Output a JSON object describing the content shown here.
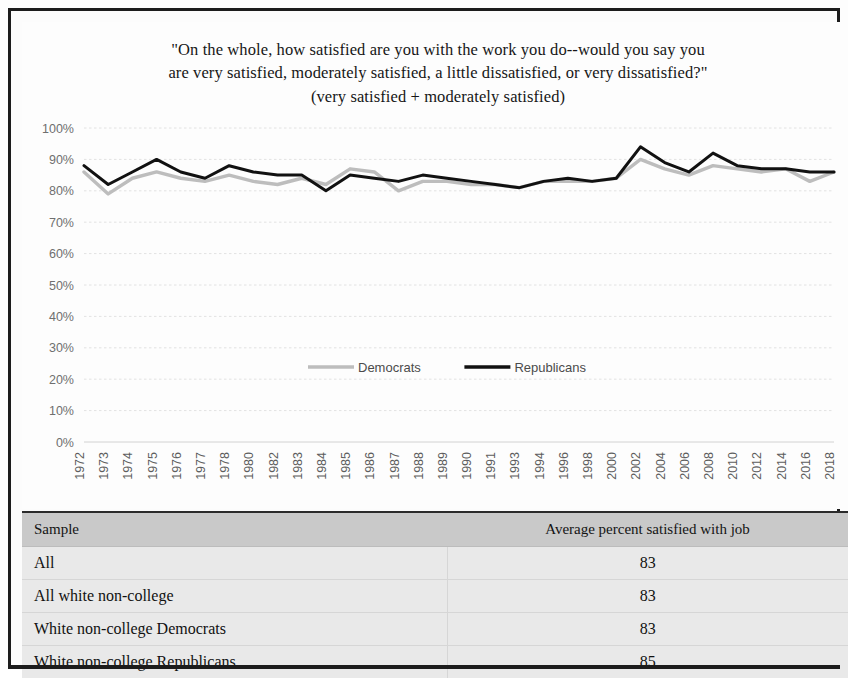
{
  "figure": {
    "title_lines": [
      "\"On the whole, how satisfied are you with the work you do--would you say you",
      "are very satisfied, moderately satisfied, a little dissatisfied, or very dissatisfied?\"",
      "(very satisfied + moderately satisfied)"
    ]
  },
  "chart_data": {
    "type": "line",
    "xlabel": "",
    "ylabel": "",
    "ylim": [
      0,
      100
    ],
    "ytick_labels": [
      "0%",
      "10%",
      "20%",
      "30%",
      "40%",
      "50%",
      "60%",
      "70%",
      "80%",
      "90%",
      "100%"
    ],
    "ytick_values": [
      0,
      10,
      20,
      30,
      40,
      50,
      60,
      70,
      80,
      90,
      100
    ],
    "grid": true,
    "legend_position": "center",
    "categories": [
      "1972",
      "1973",
      "1974",
      "1975",
      "1976",
      "1977",
      "1978",
      "1980",
      "1982",
      "1983",
      "1984",
      "1985",
      "1986",
      "1987",
      "1988",
      "1989",
      "1990",
      "1991",
      "1993",
      "1994",
      "1996",
      "1998",
      "2000",
      "2002",
      "2004",
      "2006",
      "2008",
      "2010",
      "2012",
      "2014",
      "2016",
      "2018"
    ],
    "series": [
      {
        "name": "Democrats",
        "color": "#bdbdbd",
        "values": [
          86,
          79,
          84,
          86,
          84,
          83,
          85,
          83,
          82,
          84,
          82,
          87,
          86,
          80,
          83,
          83,
          82,
          82,
          81,
          83,
          83,
          83,
          84,
          90,
          87,
          85,
          88,
          87,
          86,
          87,
          83,
          86
        ]
      },
      {
        "name": "Republicans",
        "color": "#111111",
        "values": [
          88,
          82,
          86,
          90,
          86,
          84,
          88,
          86,
          85,
          85,
          80,
          85,
          84,
          83,
          85,
          84,
          83,
          82,
          81,
          83,
          84,
          83,
          84,
          94,
          89,
          86,
          92,
          88,
          87,
          87,
          86,
          86
        ]
      }
    ]
  },
  "table": {
    "columns": [
      "Sample",
      "Average percent satisfied with job"
    ],
    "rows": [
      {
        "sample": "All",
        "value": "83"
      },
      {
        "sample": "All white non-college",
        "value": "83"
      },
      {
        "sample": "White non-college Democrats",
        "value": "83"
      },
      {
        "sample": "White non-college Republicans",
        "value": "85"
      }
    ]
  }
}
